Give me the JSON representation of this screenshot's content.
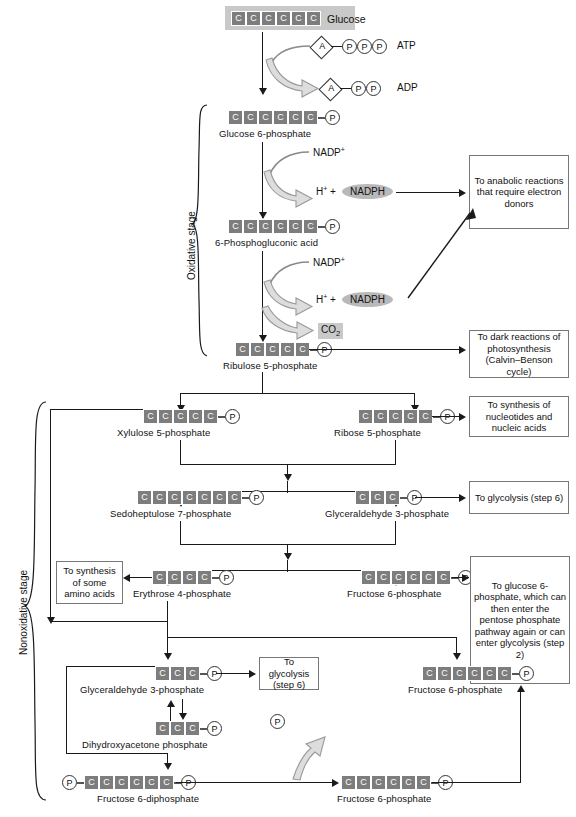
{
  "diagram": {
    "title": "Pentose phosphate pathway",
    "stages": {
      "oxidative": "Oxidative stage",
      "nonoxidative": "Nonoxidative stage"
    },
    "cofactors": {
      "atp": "ATP",
      "adp": "ADP",
      "adenosine": "A",
      "phosphate": "P",
      "nadp_plus": "NADP",
      "nadp_plus_sup": "+",
      "h_plus": "H",
      "h_plus_sup": "+",
      "plus_sign": "+",
      "nadph": "NADPH",
      "co2": "CO",
      "co2_sub": "2"
    },
    "molecules": [
      {
        "id": "glucose",
        "label": "Glucose",
        "carbons": 6,
        "carbon_letter": "C",
        "phosphates_right": 0,
        "phosphates_left": 0,
        "label_inline": true
      },
      {
        "id": "g6p",
        "label": "Glucose 6-phosphate",
        "carbons": 6,
        "carbon_letter": "C",
        "phosphates_right": 1,
        "phosphates_left": 0
      },
      {
        "id": "6pg",
        "label": "6-Phosphogluconic acid",
        "carbons": 6,
        "carbon_letter": "C",
        "phosphates_right": 1,
        "phosphates_left": 0
      },
      {
        "id": "ru5p",
        "label": "Ribulose 5-phosphate",
        "carbons": 5,
        "carbon_letter": "C",
        "phosphates_right": 1,
        "phosphates_left": 0
      },
      {
        "id": "xu5p",
        "label": "Xylulose 5-phosphate",
        "carbons": 5,
        "carbon_letter": "C",
        "phosphates_right": 1,
        "phosphates_left": 0
      },
      {
        "id": "r5p",
        "label": "Ribose 5-phosphate",
        "carbons": 5,
        "carbon_letter": "C",
        "phosphates_right": 1,
        "phosphates_left": 0
      },
      {
        "id": "s7p",
        "label": "Sedoheptulose 7-phosphate",
        "carbons": 7,
        "carbon_letter": "C",
        "phosphates_right": 1,
        "phosphates_left": 0
      },
      {
        "id": "g3p_top",
        "label": "Glyceraldehyde 3-phosphate",
        "carbons": 3,
        "carbon_letter": "C",
        "phosphates_right": 1,
        "phosphates_left": 0
      },
      {
        "id": "e4p",
        "label": "Erythrose 4-phosphate",
        "carbons": 4,
        "carbon_letter": "C",
        "phosphates_right": 1,
        "phosphates_left": 0
      },
      {
        "id": "f6p_mid",
        "label": "Fructose 6-phosphate",
        "carbons": 6,
        "carbon_letter": "C",
        "phosphates_right": 1,
        "phosphates_left": 0
      },
      {
        "id": "g3p_bottom",
        "label": "Glyceraldehyde 3-phosphate",
        "carbons": 3,
        "carbon_letter": "C",
        "phosphates_right": 1,
        "phosphates_left": 0
      },
      {
        "id": "dhap",
        "label": "Dihydroxyacetone phosphate",
        "carbons": 3,
        "carbon_letter": "C",
        "phosphates_right": 1,
        "phosphates_left": 0
      },
      {
        "id": "f6p_lower",
        "label": "Fructose 6-phosphate",
        "carbons": 6,
        "carbon_letter": "C",
        "phosphates_right": 1,
        "phosphates_left": 0
      },
      {
        "id": "fdp",
        "label": "Fructose 6-diphosphate",
        "carbons": 6,
        "carbon_letter": "C",
        "phosphates_right": 1,
        "phosphates_left": 1
      },
      {
        "id": "f6p_bottomright",
        "label": "Fructose 6-phosphate",
        "carbons": 6,
        "carbon_letter": "C",
        "phosphates_right": 1,
        "phosphates_left": 0
      }
    ],
    "fate_boxes": [
      {
        "id": "anabolic",
        "text": "To anabolic reactions that require electron donors"
      },
      {
        "id": "dark-reactions",
        "text": "To dark reactions of photosynthesis (Calvin–Benson cycle)"
      },
      {
        "id": "nucleotides",
        "text": "To synthesis of nucleotides and nucleic acids"
      },
      {
        "id": "glycolysis-6a",
        "text": "To  glycolysis (step 6)"
      },
      {
        "id": "amino-acids",
        "text": "To synthesis of some amino acids"
      },
      {
        "id": "glucose-6p",
        "text": "To glucose 6-phosphate, which can then enter the pentose phosphate pathway again or can enter glycolysis (step 2)"
      },
      {
        "id": "glycolysis-6b",
        "text": "To glycolysis (step 6)"
      }
    ],
    "colors": {
      "carbon_box": "#7d7d7d",
      "highlight_band": "#c9c9c9",
      "nadph_pill": "#b9b9b9",
      "line": "#1a1a1a",
      "box_border": "#777777"
    }
  }
}
